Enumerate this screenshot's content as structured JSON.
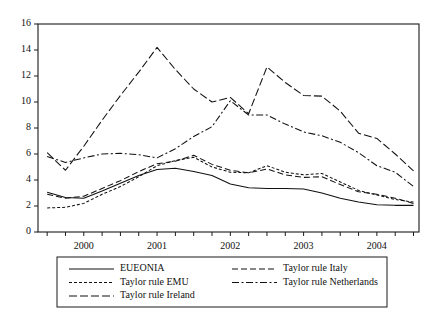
{
  "chart_data": {
    "type": "line",
    "title": "",
    "subtitle": "",
    "xlabel": "",
    "ylabel": "",
    "ylim": [
      0,
      16
    ],
    "yticks": [
      0,
      2,
      4,
      6,
      8,
      10,
      12,
      14,
      16
    ],
    "ytick_labels": [
      "0",
      "2",
      "4",
      "6",
      "8",
      "10",
      "12",
      "14",
      "16"
    ],
    "xtick_labels": [
      "2000",
      "2001",
      "2002",
      "2003",
      "2004"
    ],
    "xtick_values": [
      1999.875,
      2000.875,
      2001.875,
      2002.875,
      2003.875
    ],
    "xlim": [
      1999.25,
      2004.45
    ],
    "grid": false,
    "legend_position": "below-plot",
    "x": [
      1999.375,
      1999.625,
      1999.875,
      2000.125,
      2000.375,
      2000.625,
      2000.875,
      2001.125,
      2001.375,
      2001.625,
      2001.875,
      2002.125,
      2002.375,
      2002.625,
      2002.875,
      2003.125,
      2003.375,
      2003.625,
      2003.875,
      2004.125,
      2004.375
    ],
    "series": [
      {
        "name": "EUEONIA",
        "style": "solid",
        "values": [
          3.05,
          2.65,
          2.6,
          3.15,
          3.75,
          4.35,
          4.8,
          4.9,
          4.65,
          4.35,
          3.7,
          3.4,
          3.35,
          3.35,
          3.3,
          3.0,
          2.6,
          2.3,
          2.1,
          2.05,
          2.05
        ]
      },
      {
        "name": "Taylor rule EMU",
        "style": "dotted-short-dash",
        "values": [
          1.85,
          1.9,
          2.2,
          2.9,
          3.5,
          4.25,
          5.1,
          5.5,
          5.75,
          5.0,
          4.6,
          4.55,
          5.1,
          4.6,
          4.4,
          4.5,
          3.85,
          3.2,
          2.85,
          2.5,
          2.3
        ]
      },
      {
        "name": "Taylor rule Ireland",
        "style": "long-dash",
        "values": [
          6.1,
          4.75,
          6.6,
          8.6,
          10.5,
          12.3,
          14.2,
          12.5,
          11.0,
          10.0,
          10.35,
          9.1,
          12.7,
          11.5,
          10.5,
          10.45,
          9.3,
          7.6,
          7.2,
          6.0,
          4.7
        ]
      },
      {
        "name": "Taylor rule Italy",
        "style": "medium-dash",
        "values": [
          2.9,
          2.6,
          2.75,
          3.35,
          3.95,
          4.65,
          5.25,
          5.45,
          5.9,
          5.2,
          4.75,
          4.55,
          4.85,
          4.4,
          4.2,
          4.25,
          3.65,
          3.1,
          2.9,
          2.6,
          2.2
        ]
      },
      {
        "name": "Taylor rule Netherlands",
        "style": "dash-dot",
        "values": [
          5.8,
          5.35,
          5.7,
          6.0,
          6.05,
          5.95,
          5.7,
          6.4,
          7.35,
          8.1,
          10.1,
          9.0,
          9.0,
          8.3,
          7.7,
          7.4,
          6.9,
          6.1,
          5.1,
          4.6,
          3.5
        ]
      }
    ],
    "legend": [
      {
        "label": "EUEONIA",
        "style": "solid",
        "column": 0
      },
      {
        "label": "Taylor rule EMU",
        "style": "dotted-short-dash",
        "column": 0
      },
      {
        "label": "Taylor rule Ireland",
        "style": "long-dash",
        "column": 0
      },
      {
        "label": "Taylor rule Italy",
        "style": "medium-dash",
        "column": 1
      },
      {
        "label": "Taylor rule Netherlands",
        "style": "dash-dot",
        "column": 1
      }
    ]
  }
}
